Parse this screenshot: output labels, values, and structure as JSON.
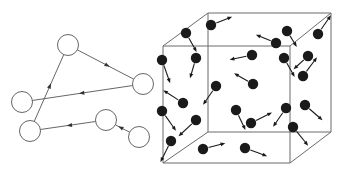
{
  "figure": {
    "background_color": "#ffffff",
    "width": 344,
    "height": 174
  },
  "colors": {
    "background": "#ffffff",
    "node_fill": "#ffffff",
    "node_stroke": "#555555",
    "edge_stroke": "#555555",
    "arrow_fill": "#333333",
    "cube_edge": "#6b6b6b",
    "particle_fill": "#1a1a1a",
    "velocity_stroke": "#1a1a1a"
  },
  "left_panel": {
    "name": "directed-graph",
    "node_radius": 10.5,
    "nodes": [
      {
        "id": "n0",
        "label": "",
        "cx": 68,
        "cy": 45
      },
      {
        "id": "n1",
        "label": "",
        "cx": 143,
        "cy": 84
      },
      {
        "id": "n2",
        "label": "",
        "cx": 22,
        "cy": 102
      },
      {
        "id": "n3",
        "label": "",
        "cx": 30,
        "cy": 131
      },
      {
        "id": "n4",
        "label": "",
        "cx": 106,
        "cy": 120
      },
      {
        "id": "n5",
        "label": "",
        "cx": 139,
        "cy": 137
      }
    ],
    "edges": [
      {
        "from": "n0",
        "to": "n1",
        "arrow_at": 0.52
      },
      {
        "from": "n1",
        "to": "n2",
        "arrow_at": 0.5
      },
      {
        "from": "n3",
        "to": "n0",
        "arrow_at": 0.52
      },
      {
        "from": "n4",
        "to": "n3",
        "arrow_at": 0.46
      },
      {
        "from": "n5",
        "to": "n4",
        "arrow_at": 0.58
      }
    ]
  },
  "right_panel": {
    "name": "particle-cube",
    "particle_radius": 5.2,
    "cube": {
      "front_top_left": {
        "x": 163,
        "y": 46
      },
      "front_top_right": {
        "x": 290,
        "y": 46
      },
      "front_bottom_left": {
        "x": 163,
        "y": 163
      },
      "front_bottom_right": {
        "x": 290,
        "y": 163
      },
      "back_top_left": {
        "x": 208,
        "y": 13
      },
      "back_top_right": {
        "x": 331,
        "y": 13
      },
      "back_bottom_left": {
        "x": 208,
        "y": 132
      },
      "back_bottom_right": {
        "x": 331,
        "y": 132
      }
    },
    "particles": [
      {
        "x": 211,
        "y": 25,
        "vx": 18,
        "vy": -7
      },
      {
        "x": 186,
        "y": 33,
        "vx": 9,
        "vy": 16
      },
      {
        "x": 287,
        "y": 31,
        "vx": 8,
        "vy": 13
      },
      {
        "x": 276,
        "y": 43,
        "vx": -17,
        "vy": -7
      },
      {
        "x": 318,
        "y": 34,
        "vx": 11,
        "vy": -16
      },
      {
        "x": 196,
        "y": 58,
        "vx": -5,
        "vy": 17
      },
      {
        "x": 252,
        "y": 55,
        "vx": -19,
        "vy": 4
      },
      {
        "x": 284,
        "y": 58,
        "vx": 9,
        "vy": 16
      },
      {
        "x": 308,
        "y": 56,
        "vx": -12,
        "vy": 11
      },
      {
        "x": 162,
        "y": 60,
        "vx": 7,
        "vy": 20
      },
      {
        "x": 303,
        "y": 76,
        "vx": 12,
        "vy": -16
      },
      {
        "x": 253,
        "y": 84,
        "vx": -16,
        "vy": -9
      },
      {
        "x": 216,
        "y": 86,
        "vx": -11,
        "vy": 16
      },
      {
        "x": 183,
        "y": 103,
        "vx": -17,
        "vy": -11
      },
      {
        "x": 162,
        "y": 111,
        "vx": 12,
        "vy": 17
      },
      {
        "x": 196,
        "y": 120,
        "vx": -15,
        "vy": 14
      },
      {
        "x": 236,
        "y": 110,
        "vx": 8,
        "vy": 17
      },
      {
        "x": 251,
        "y": 123,
        "vx": 18,
        "vy": -9
      },
      {
        "x": 286,
        "y": 108,
        "vx": -11,
        "vy": 16
      },
      {
        "x": 305,
        "y": 105,
        "vx": 15,
        "vy": 13
      },
      {
        "x": 293,
        "y": 127,
        "vx": 13,
        "vy": 16
      },
      {
        "x": 203,
        "y": 149,
        "vx": 19,
        "vy": -5
      },
      {
        "x": 245,
        "y": 148,
        "vx": 19,
        "vy": 7
      },
      {
        "x": 171,
        "y": 141,
        "vx": -9,
        "vy": 18
      }
    ]
  }
}
